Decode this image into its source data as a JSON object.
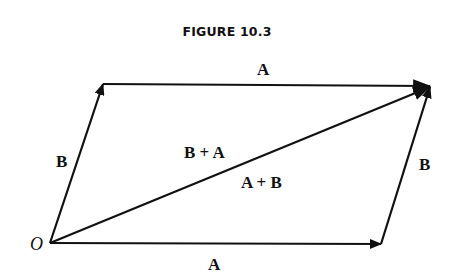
{
  "figure": {
    "title": "FIGURE 10.3"
  },
  "labels": {
    "origin": "O",
    "bottom_vector": "A",
    "top_vector": "A",
    "left_vector": "B",
    "right_vector": "B",
    "diagonal_upper": "B + A",
    "diagonal_lower": "A + B"
  },
  "colors": {
    "stroke": "#111111",
    "background": "#ffffff"
  }
}
